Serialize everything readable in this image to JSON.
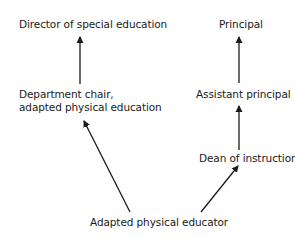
{
  "diagram": {
    "type": "organizational-hierarchy",
    "nodes": {
      "director": "Director of special education",
      "dept_chair_line1": "Department chair,",
      "dept_chair_line2": "adapted physical education",
      "principal": "Principal",
      "assistant_principal": "Assistant principal",
      "dean": "Dean of instruction",
      "educator": "Adapted physical educator"
    },
    "edges": [
      {
        "from": "Department chair, adapted physical education",
        "to": "Director of special education"
      },
      {
        "from": "Assistant principal",
        "to": "Principal"
      },
      {
        "from": "Dean of instruction",
        "to": "Assistant principal"
      },
      {
        "from": "Adapted physical educator",
        "to": "Department chair, adapted physical education"
      },
      {
        "from": "Adapted physical educator",
        "to": "Dean of instruction"
      }
    ],
    "colors": {
      "line": "#1a1a1a",
      "background": "#ffffff"
    }
  }
}
